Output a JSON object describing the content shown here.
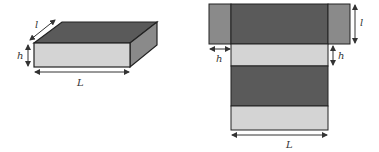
{
  "figure": {
    "box3d": {
      "labels": {
        "length": "L",
        "width": "l",
        "height": "h"
      }
    },
    "net": {
      "labels": {
        "length": "L",
        "width": "l",
        "height_left": "h",
        "height_right": "h"
      }
    }
  },
  "colors": {
    "dark_face": "#5a5a5a",
    "light_face": "#d4d4d4",
    "side_face": "#8a8a8a",
    "outline": "#222222",
    "arrow": "#333333"
  }
}
